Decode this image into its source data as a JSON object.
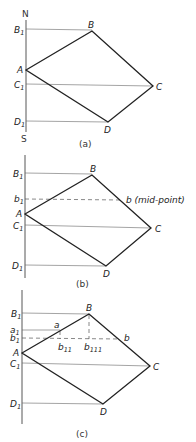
{
  "figure": {
    "panels": [
      {
        "id": "a",
        "caption": "(a)",
        "axis": {
          "top_label": "N",
          "bottom_label": "S"
        },
        "points": {
          "A": "A",
          "B": "B",
          "C": "C",
          "D": "D",
          "B1": "B",
          "C1": "C",
          "D1": "D"
        }
      },
      {
        "id": "b",
        "caption": "(b)",
        "points": {
          "A": "A",
          "B": "B",
          "C": "C",
          "D": "D",
          "B1": "B",
          "C1": "C",
          "D1": "D",
          "b": "b (mid-point)",
          "b1": "b"
        }
      },
      {
        "id": "c",
        "caption": "(c)",
        "points": {
          "A": "A",
          "B": "B",
          "C": "C",
          "D": "D",
          "B1": "B",
          "C1": "C",
          "D1": "D",
          "a": "a",
          "a1": "a",
          "b": "b",
          "b1": "b",
          "b11": "b",
          "b111": "b"
        }
      }
    ],
    "subscripts": {
      "one": "1",
      "eleven": "11",
      "hundred_eleven": "111"
    }
  }
}
